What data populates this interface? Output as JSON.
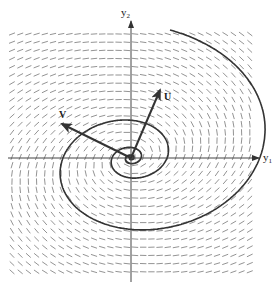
{
  "figure": {
    "type": "direction-field-phase-portrait",
    "axes": {
      "horizontal": {
        "name": "y",
        "subscript": "1"
      },
      "vertical": {
        "name": "y",
        "subscript": "2"
      }
    },
    "vectors": [
      {
        "label": "U",
        "direction": "up-right"
      },
      {
        "label": "V",
        "direction": "up-left"
      }
    ],
    "trajectory": "spiral into origin (stable focus)",
    "colors": {
      "field": "#666666",
      "trajectory": "#333333",
      "axes": "#444444",
      "vectors": "#333333"
    }
  }
}
